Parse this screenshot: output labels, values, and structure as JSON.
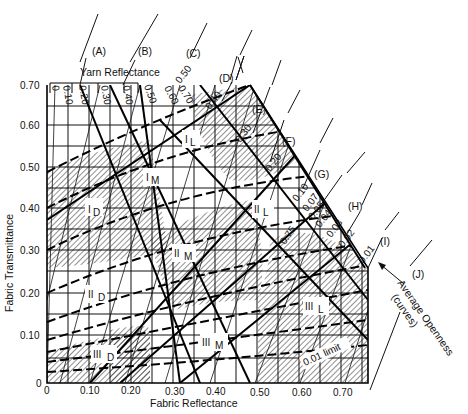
{
  "diagram": {
    "x_axis": {
      "title": "Fabric Reflectance",
      "ticks": [
        "0",
        "0.10",
        "0.20",
        "0.30",
        "0.40",
        "0.50",
        "0.60",
        "0.70"
      ]
    },
    "y_axis": {
      "title": "Fabric Transmittance",
      "ticks": [
        "0",
        "0.10",
        "0.20",
        "0.30",
        "0.40",
        "0.50",
        "0.60",
        "0.70"
      ]
    },
    "yarn_reflectance": {
      "title": "Yarn Reflectance",
      "ticks": [
        "0",
        "0.10",
        "0.20",
        "0.30",
        "0.40",
        "0.50",
        "0.60",
        "0.70",
        "0.75"
      ]
    },
    "openness_scale": {
      "title_line1": "Average Openness",
      "title_line2": "(curves)",
      "ticks": [
        "0.50",
        "0.40",
        "0.30",
        "0.20",
        "0.10",
        "0.07",
        "0.05",
        "0.04",
        "0.03",
        "0.02",
        "0.01"
      ],
      "limit_label": "0.01 limit"
    },
    "callouts": [
      "(A)",
      "(B)",
      "(C)",
      "(D)",
      "(E)",
      "(F)",
      "(G)",
      "(H)",
      "(I)",
      "(J)"
    ],
    "zones": [
      {
        "id": "I_D",
        "main": "I",
        "sub": "D"
      },
      {
        "id": "I_M",
        "main": "I",
        "sub": "M"
      },
      {
        "id": "I_L",
        "main": "I",
        "sub": "L"
      },
      {
        "id": "II_D",
        "main": "II",
        "sub": "D"
      },
      {
        "id": "II_M",
        "main": "II",
        "sub": "M"
      },
      {
        "id": "II_L",
        "main": "II",
        "sub": "L"
      },
      {
        "id": "III_D",
        "main": "III",
        "sub": "D"
      },
      {
        "id": "III_M",
        "main": "III",
        "sub": "M"
      },
      {
        "id": "III_L",
        "main": "III",
        "sub": "L"
      }
    ]
  }
}
